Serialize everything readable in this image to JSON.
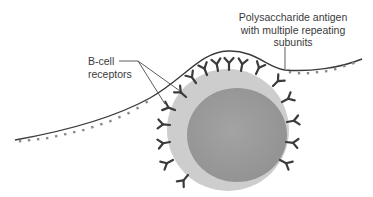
{
  "diagram": {
    "labels": {
      "antigen": {
        "lines": [
          "Polysaccharide antigen",
          "with multiple repeating",
          "subunits"
        ]
      },
      "receptors": {
        "lines": [
          "B-cell",
          "receptors"
        ]
      }
    },
    "elements": {
      "cell": "B cell (cytoplasm + nucleus)",
      "antigen_strand": "polysaccharide chain with repeating subunits",
      "receptors": "Y-shaped B-cell receptors around cell surface"
    },
    "colors": {
      "background": "#ffffff",
      "cell_outer": "#cdcdcd",
      "cell_nucleus": "#9b9b9b",
      "receptor": "#3b3b3b",
      "antigen_line": "#3b3b3b",
      "antigen_subunit": "#8a8a8a",
      "leader_line": "#4a4a4a",
      "label_text": "#3a3a3a"
    }
  }
}
